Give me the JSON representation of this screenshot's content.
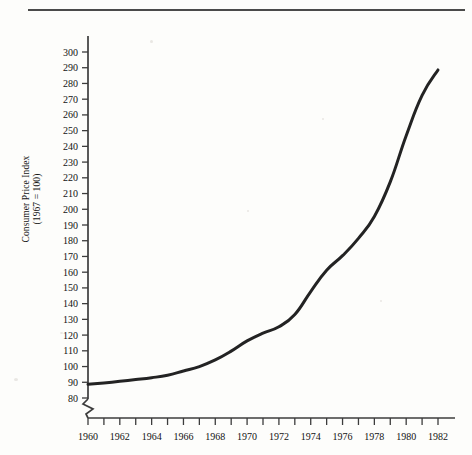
{
  "figure": {
    "background_color": "#fdfdfb",
    "ink_color": "#232323",
    "axis_color": "#3c3c3c",
    "top_rule": "horizontal-rule"
  },
  "chart_data": {
    "type": "line",
    "title": "",
    "xlabel": "",
    "ylabel": "Consumer Price Index (1967 = 100)",
    "ylabel_line1": "Consumer Price Index",
    "ylabel_line2": "(1967 = 100)",
    "grid": false,
    "legend": "none",
    "xlim": [
      1960,
      1982
    ],
    "ylim": [
      80,
      305
    ],
    "y_axis_broken": true,
    "y_axis_break_note": "zigzag break below 80",
    "yticks": [
      80,
      90,
      100,
      110,
      120,
      130,
      140,
      150,
      160,
      170,
      180,
      190,
      200,
      210,
      220,
      230,
      240,
      250,
      260,
      270,
      280,
      290,
      300
    ],
    "xticks": [
      1960,
      1961,
      1962,
      1963,
      1964,
      1965,
      1966,
      1967,
      1968,
      1969,
      1970,
      1971,
      1972,
      1973,
      1974,
      1975,
      1976,
      1977,
      1978,
      1979,
      1980,
      1981,
      1982
    ],
    "xtick_labels": [
      "1960",
      "",
      "1962",
      "",
      "1964",
      "",
      "1966",
      "",
      "1968",
      "",
      "1970",
      "",
      "1972",
      "",
      "1974",
      "",
      "1976",
      "",
      "1978",
      "",
      "1980",
      "",
      "1982"
    ],
    "x": [
      1960,
      1961,
      1962,
      1963,
      1964,
      1965,
      1966,
      1967,
      1968,
      1969,
      1970,
      1971,
      1972,
      1973,
      1974,
      1975,
      1976,
      1977,
      1978,
      1979,
      1980,
      1981,
      1982
    ],
    "values": [
      88.7,
      89.6,
      90.6,
      91.7,
      92.9,
      94.5,
      97.2,
      100.0,
      104.2,
      109.8,
      116.3,
      121.3,
      125.3,
      133.1,
      147.7,
      161.2,
      170.5,
      181.5,
      195.4,
      217.4,
      246.8,
      272.4,
      288.6
    ],
    "series": [
      {
        "name": "Consumer Price Index",
        "values": [
          88.7,
          89.6,
          90.6,
          91.7,
          92.9,
          94.5,
          97.2,
          100.0,
          104.2,
          109.8,
          116.3,
          121.3,
          125.3,
          133.1,
          147.7,
          161.2,
          170.5,
          181.5,
          195.4,
          217.4,
          246.8,
          272.4,
          288.6
        ]
      }
    ]
  }
}
